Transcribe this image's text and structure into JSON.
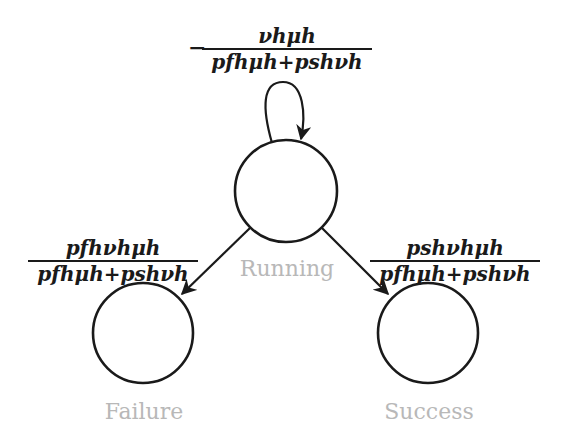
{
  "diagram": {
    "type": "state-transition",
    "states": [
      {
        "id": "running",
        "label": "Running"
      },
      {
        "id": "failure",
        "label": "Failure"
      },
      {
        "id": "success",
        "label": "Success"
      }
    ],
    "transitions": {
      "self_loop": {
        "from": "running",
        "to": "running",
        "sign": "−",
        "numerator": "νhμh",
        "denominator": "pfhμh+pshνh"
      },
      "to_failure": {
        "from": "running",
        "to": "failure",
        "numerator": "pfhνhμh",
        "denominator": "pfhμh+pshνh"
      },
      "to_success": {
        "from": "running",
        "to": "success",
        "numerator": "pshνhμh",
        "denominator": "pfhμh+pshνh"
      }
    }
  }
}
